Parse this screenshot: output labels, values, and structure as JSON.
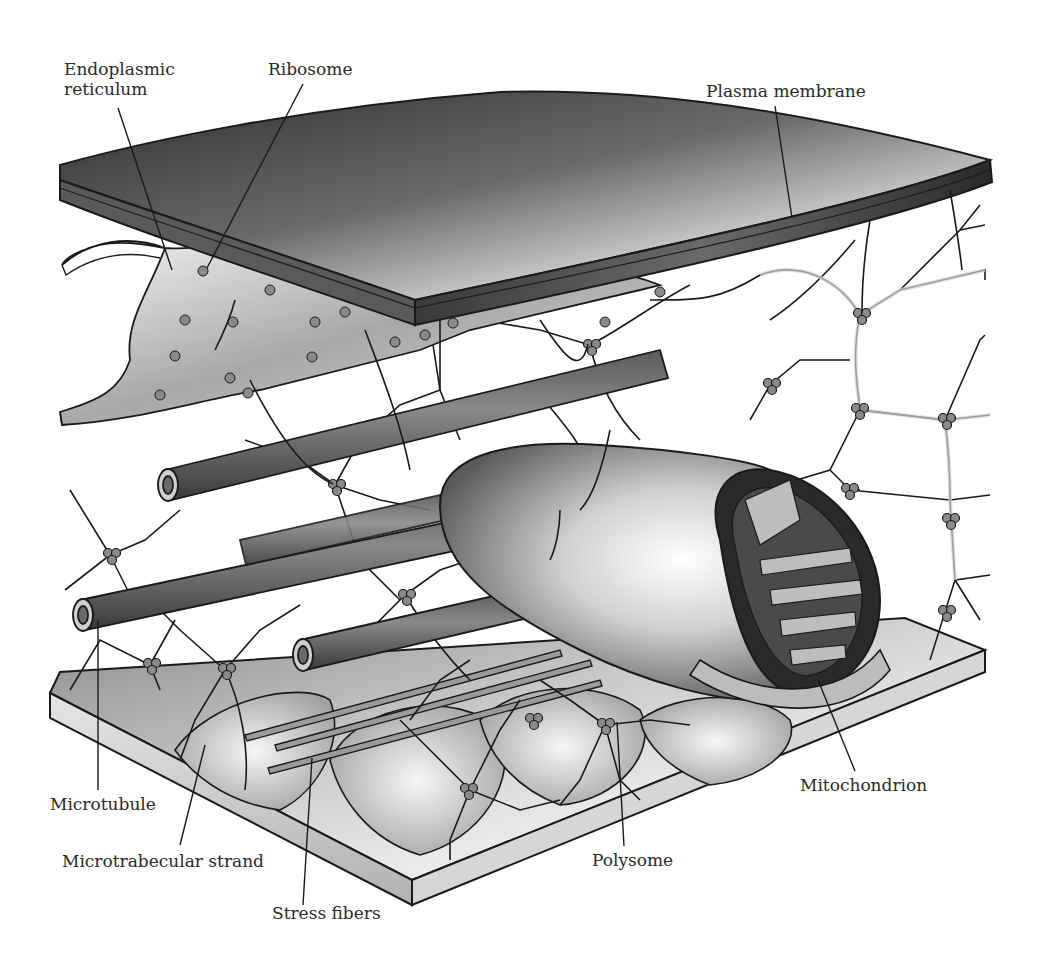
{
  "figure": {
    "colors": {
      "ink": "#1a1a1a",
      "membrane_dark": "#3a3a3a",
      "membrane_mid": "#7a7a7a",
      "membrane_light": "#e8e8e8",
      "slab_light": "#dcdcdc",
      "strand_fill": "#d8d8d8",
      "background": "#ffffff"
    }
  },
  "labels": {
    "endoplasmic_reticulum": "Endoplasmic\nreticulum",
    "ribosome": "Ribosome",
    "plasma_membrane": "Plasma membrane",
    "microtubule": "Microtubule",
    "microtrabecular_strand": "Microtrabecular strand",
    "stress_fibers": "Stress fibers",
    "polysome": "Polysome",
    "mitochondrion": "Mitochondrion"
  }
}
